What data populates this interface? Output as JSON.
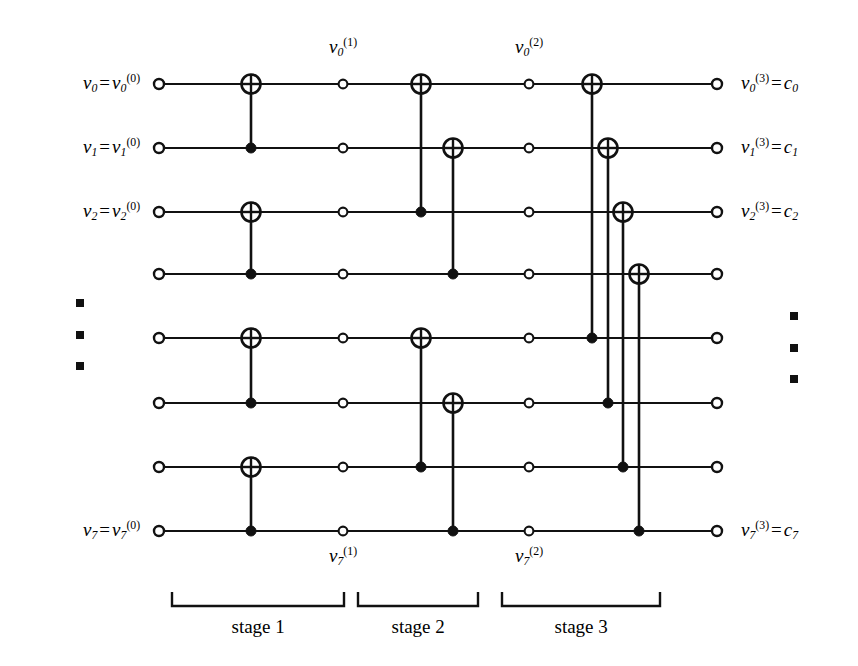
{
  "figure": {
    "type": "polar-code-encoder-circuit",
    "rows": 8,
    "stages": 3,
    "background_color": "#ffffff",
    "ink_color": "#111111"
  },
  "input_labels": [
    {
      "row": 0,
      "text": "v0 = v0(0)",
      "base": "v",
      "sub": "0",
      "sup": "(0)"
    },
    {
      "row": 1,
      "text": "v1 = v1(0)",
      "base": "v",
      "sub": "1",
      "sup": "(0)"
    },
    {
      "row": 2,
      "text": "v2 = v2(0)",
      "base": "v",
      "sub": "2",
      "sup": "(0)"
    },
    {
      "row": 7,
      "text": "v7 = v7(0)",
      "base": "v",
      "sub": "7",
      "sup": "(0)"
    }
  ],
  "output_labels": [
    {
      "row": 0,
      "base": "v",
      "sub": "0",
      "sup": "(3)",
      "equals": "c",
      "equals_sub": "0"
    },
    {
      "row": 1,
      "base": "v",
      "sub": "1",
      "sup": "(3)",
      "equals": "c",
      "equals_sub": "1"
    },
    {
      "row": 2,
      "base": "v",
      "sub": "2",
      "sup": "(3)",
      "equals": "c",
      "equals_sub": "2"
    },
    {
      "row": 7,
      "base": "v",
      "sub": "7",
      "sup": "(3)",
      "equals": "c",
      "equals_sub": "7"
    }
  ],
  "intermediate_labels": [
    {
      "id": "v0_1",
      "base": "v",
      "sub": "0",
      "sup": "(1)",
      "position": "top",
      "x": 343,
      "y": 48
    },
    {
      "id": "v0_2",
      "base": "v",
      "sub": "0",
      "sup": "(2)",
      "position": "top",
      "x": 529,
      "y": 48
    },
    {
      "id": "v7_1",
      "base": "v",
      "sub": "7",
      "sup": "(1)",
      "position": "bottom",
      "x": 343,
      "y": 557
    },
    {
      "id": "v7_2",
      "base": "v",
      "sub": "7",
      "sup": "(2)",
      "position": "bottom",
      "x": 529,
      "y": 557
    }
  ],
  "stages": [
    {
      "index": 1,
      "label": "stage 1",
      "bracket_x0": 172,
      "bracket_x1": 344,
      "label_x": 258,
      "label_y": 627
    },
    {
      "index": 2,
      "label": "stage 2",
      "bracket_x0": 358,
      "bracket_x1": 478,
      "label_x": 418,
      "label_y": 627
    },
    {
      "index": 3,
      "label": "stage 3",
      "bracket_x0": 502,
      "bracket_x1": 660,
      "label_x": 581,
      "label_y": 627
    }
  ],
  "geometry": {
    "row_y": [
      84,
      148,
      212,
      274,
      338,
      403,
      467,
      531
    ],
    "x_input": 159,
    "x_stage1": 251,
    "x_mid1": 343,
    "x_stage2a": 421,
    "x_stage2b": 453,
    "x_mid2": 529,
    "x_stage3": [
      592,
      608,
      623,
      639
    ],
    "x_output": 717,
    "wire_start": 159,
    "wire_end": 717,
    "bracket_y_top": 592,
    "bracket_y_bottom": 606
  },
  "gates": {
    "stage1": [
      {
        "xor_row": 0,
        "ctrl_row": 1,
        "x": 251
      },
      {
        "xor_row": 2,
        "ctrl_row": 3,
        "x": 251
      },
      {
        "xor_row": 4,
        "ctrl_row": 5,
        "x": 251
      },
      {
        "xor_row": 6,
        "ctrl_row": 7,
        "x": 251
      }
    ],
    "stage2": [
      {
        "xor_row": 0,
        "ctrl_row": 2,
        "x": 421
      },
      {
        "xor_row": 1,
        "ctrl_row": 3,
        "x": 453
      },
      {
        "xor_row": 4,
        "ctrl_row": 6,
        "x": 421
      },
      {
        "xor_row": 5,
        "ctrl_row": 7,
        "x": 453
      }
    ],
    "stage3": [
      {
        "xor_row": 0,
        "ctrl_row": 4,
        "x": 592
      },
      {
        "xor_row": 1,
        "ctrl_row": 5,
        "x": 608
      },
      {
        "xor_row": 2,
        "ctrl_row": 6,
        "x": 623
      },
      {
        "xor_row": 3,
        "ctrl_row": 7,
        "x": 639
      }
    ]
  },
  "ellipses": [
    {
      "id": "left-ellipsis",
      "x": 80,
      "ys": [
        303,
        335,
        366
      ]
    },
    {
      "id": "right-ellipsis",
      "x": 794,
      "ys": [
        316,
        348,
        379
      ]
    }
  ],
  "nodes": {
    "input_circle_r": 5.0,
    "mid_circle_r": 4.4,
    "output_circle_r": 5.0,
    "ctrl_dot_r": 5.0,
    "xor_r": 9.5
  }
}
